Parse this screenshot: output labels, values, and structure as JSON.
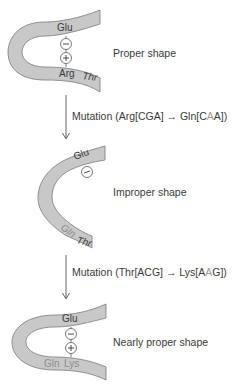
{
  "colors": {
    "strand_fill": "#c8c8c8",
    "strand_stroke": "#7a7a7a",
    "text": "#3a3a3a",
    "highlight_text": "#9a9a9a",
    "arrow": "#555555"
  },
  "stages": [
    {
      "label": "Proper shape",
      "residues": {
        "top": "Glu",
        "bottom_left": "Arg",
        "bottom_right": "Thr"
      },
      "charges": [
        "−",
        "+"
      ]
    },
    {
      "label": "Improper shape",
      "residues": {
        "top": "Glu",
        "bottom_left": "Gln",
        "bottom_right": "Thr"
      },
      "charges": [
        "−"
      ]
    },
    {
      "label": "Nearly proper shape",
      "residues": {
        "top": "Glu",
        "bottom_left": "Gln",
        "bottom_right": "Lys"
      },
      "charges": [
        "−",
        "+"
      ]
    }
  ],
  "mutations": [
    {
      "prefix": "Mutation (Arg[CGA] ",
      "arrow": "→",
      "middle": " Gln[C",
      "highlight": "A",
      "suffix": "A])"
    },
    {
      "prefix": "Mutation (Thr[ACG] ",
      "arrow": "→",
      "middle": " Lys[A",
      "highlight": "A",
      "suffix": "G])"
    }
  ]
}
